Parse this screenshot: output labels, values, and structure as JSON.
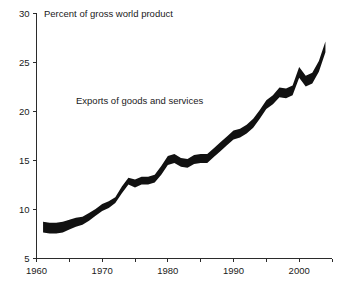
{
  "chart_data": {
    "type": "area",
    "title": "",
    "subtitle": "",
    "axis_title": "Percent of gross world product",
    "series_label": "Exports of goods and services",
    "xlabel": "",
    "ylabel": "Percent of gross world product",
    "xlim": [
      1960,
      2005
    ],
    "ylim": [
      5,
      30
    ],
    "grid": false,
    "legend_position": "inline-annotation",
    "band_color": "#111111",
    "axis_color": "#2b2b2b",
    "x_ticks_major": [
      1960,
      1970,
      1980,
      1990,
      2000
    ],
    "x_tick_labels": [
      "1960",
      "1970",
      "1980",
      "1990",
      "2000"
    ],
    "x_ticks_minor": [
      1965,
      1975,
      1985,
      1995,
      2005
    ],
    "y_ticks": [
      5,
      10,
      15,
      20,
      25,
      30
    ],
    "y_tick_labels": [
      "5",
      "10",
      "15",
      "20",
      "25",
      "30"
    ],
    "x": [
      1961,
      1962,
      1963,
      1964,
      1965,
      1966,
      1967,
      1968,
      1969,
      1970,
      1971,
      1972,
      1973,
      1974,
      1975,
      1976,
      1977,
      1978,
      1979,
      1980,
      1981,
      1982,
      1983,
      1984,
      1985,
      1986,
      1987,
      1988,
      1989,
      1990,
      1991,
      1992,
      1993,
      1994,
      1995,
      1996,
      1997,
      1998,
      1999,
      2000,
      2001,
      2002,
      2003,
      2004
    ],
    "series": [
      {
        "name": "upper bound",
        "values": [
          8.7,
          8.6,
          8.6,
          8.7,
          8.9,
          9.1,
          9.2,
          9.6,
          10.0,
          10.5,
          10.8,
          11.2,
          12.3,
          13.2,
          13.0,
          13.3,
          13.3,
          13.5,
          14.4,
          15.4,
          15.6,
          15.2,
          15.1,
          15.5,
          15.6,
          15.6,
          16.2,
          16.8,
          17.4,
          18.0,
          18.2,
          18.6,
          19.2,
          20.1,
          21.1,
          21.6,
          22.4,
          22.3,
          22.6,
          24.5,
          23.6,
          23.9,
          25.1,
          27.1
        ]
      },
      {
        "name": "lower bound",
        "values": [
          7.6,
          7.5,
          7.5,
          7.6,
          7.9,
          8.2,
          8.4,
          8.8,
          9.3,
          9.8,
          10.1,
          10.6,
          11.6,
          12.5,
          12.2,
          12.5,
          12.5,
          12.7,
          13.5,
          14.5,
          14.7,
          14.3,
          14.2,
          14.6,
          14.7,
          14.7,
          15.3,
          15.9,
          16.5,
          17.1,
          17.3,
          17.7,
          18.3,
          19.2,
          20.2,
          20.7,
          21.4,
          21.3,
          21.6,
          23.4,
          22.5,
          22.8,
          24.0,
          26.0
        ]
      }
    ]
  },
  "annotations": {
    "axis_title": "Percent of gross world product",
    "series_label": "Exports of goods and services"
  }
}
